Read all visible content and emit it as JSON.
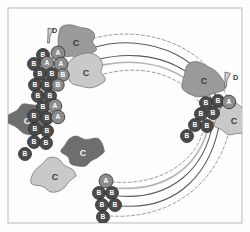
{
  "figure": {
    "type": "circular-arc-diagram",
    "background_color": "#fefefe",
    "frame": {
      "name": "plot-frame",
      "x": 8,
      "y": 8,
      "width": 234,
      "height": 215,
      "stroke": "#b9b9b9",
      "stroke_width": 1
    },
    "palette": {
      "blob_dark": "#6e6e6e",
      "blob_medium": "#9a9a9a",
      "blob_light": "#c9c9c9",
      "blob_lighter": "#d8d8d8",
      "blob_stroke": "#6a6a6a",
      "badge_fill": "#4b4b4b",
      "badge_fill_light": "#8c8c8c",
      "badge_text": "#ffffff",
      "badge_stroke": "#2e2e2e",
      "arc_dark": "#5a5a5a",
      "arc_light": "#b5b5b5",
      "arc_dashed": "#9a9a9a",
      "pin_fill": "#cdcdcd",
      "pin_stroke": "#555555",
      "label_text": "#3a3a3a"
    },
    "labels": {
      "blob": "C",
      "badge_a": "A",
      "badge_b": "B",
      "pin": "D"
    }
  },
  "chart_data": {
    "type": "scatter",
    "title": "",
    "subtitle": "",
    "xlabel": "",
    "ylabel": "",
    "grid": false,
    "legend": null,
    "xlim": [
      0,
      250
    ],
    "ylim": [
      0,
      232
    ],
    "blobs": [
      {
        "id": "blob-1",
        "label": "C",
        "cx": 76,
        "cy": 42,
        "rx": 22,
        "ry": 18,
        "shade": "blob_medium",
        "label_x": 76,
        "label_y": 44,
        "label_size": 9
      },
      {
        "id": "blob-2",
        "label": "C",
        "cx": 85,
        "cy": 72,
        "rx": 24,
        "ry": 18,
        "shade": "blob_light",
        "label_x": 86,
        "label_y": 74,
        "label_size": 9
      },
      {
        "id": "blob-3",
        "label": "C",
        "cx": 27,
        "cy": 120,
        "rx": 22,
        "ry": 17,
        "shade": "blob_dark",
        "label_x": 27,
        "label_y": 122,
        "label_size": 9
      },
      {
        "id": "blob-4",
        "label": "C",
        "cx": 82,
        "cy": 152,
        "rx": 22,
        "ry": 17,
        "shade": "blob_dark",
        "label_x": 83,
        "label_y": 154,
        "label_size": 9
      },
      {
        "id": "blob-5",
        "label": "C",
        "cx": 54,
        "cy": 176,
        "rx": 24,
        "ry": 19,
        "shade": "blob_light",
        "label_x": 55,
        "label_y": 178,
        "label_size": 9
      },
      {
        "id": "blob-6",
        "label": "C",
        "cx": 203,
        "cy": 80,
        "rx": 24,
        "ry": 19,
        "shade": "blob_medium",
        "label_x": 204,
        "label_y": 82,
        "label_size": 9
      },
      {
        "id": "blob-7",
        "label": "C",
        "cx": 232,
        "cy": 120,
        "rx": 22,
        "ry": 17,
        "shade": "blob_light",
        "label_x": 234,
        "label_y": 122,
        "label_size": 9
      }
    ],
    "badges": [
      {
        "id": "n1",
        "label": "B",
        "cx": 43,
        "cy": 55,
        "r": 6.5,
        "tone": "badge_fill"
      },
      {
        "id": "n2",
        "label": "A",
        "cx": 58,
        "cy": 53,
        "r": 7.0,
        "tone": "badge_fill_light"
      },
      {
        "id": "n3",
        "label": "B",
        "cx": 34,
        "cy": 64,
        "r": 6.5,
        "tone": "badge_fill"
      },
      {
        "id": "n4",
        "label": "A",
        "cx": 47,
        "cy": 63,
        "r": 6.8,
        "tone": "badge_fill_light"
      },
      {
        "id": "n5",
        "label": "A",
        "cx": 61,
        "cy": 64,
        "r": 6.8,
        "tone": "badge_fill_light"
      },
      {
        "id": "n6",
        "label": "B",
        "cx": 40,
        "cy": 74,
        "r": 6.5,
        "tone": "badge_fill"
      },
      {
        "id": "n7",
        "label": "B",
        "cx": 52,
        "cy": 74,
        "r": 6.5,
        "tone": "badge_fill"
      },
      {
        "id": "n8",
        "label": "B",
        "cx": 63,
        "cy": 75,
        "r": 6.2,
        "tone": "badge_fill_light"
      },
      {
        "id": "n9",
        "label": "B",
        "cx": 35,
        "cy": 85,
        "r": 6.5,
        "tone": "badge_fill"
      },
      {
        "id": "n10",
        "label": "B",
        "cx": 47,
        "cy": 85,
        "r": 6.5,
        "tone": "badge_fill"
      },
      {
        "id": "n11",
        "label": "B",
        "cx": 58,
        "cy": 85,
        "r": 6.2,
        "tone": "badge_fill_light"
      },
      {
        "id": "n12",
        "label": "B",
        "cx": 38,
        "cy": 96,
        "r": 6.5,
        "tone": "badge_fill"
      },
      {
        "id": "n13",
        "label": "B",
        "cx": 50,
        "cy": 96,
        "r": 6.5,
        "tone": "badge_fill"
      },
      {
        "id": "n14",
        "label": "B",
        "cx": 43,
        "cy": 107,
        "r": 6.5,
        "tone": "badge_fill"
      },
      {
        "id": "n15",
        "label": "A",
        "cx": 55,
        "cy": 106,
        "r": 6.8,
        "tone": "badge_fill_light"
      },
      {
        "id": "n16",
        "label": "B",
        "cx": 34,
        "cy": 116,
        "r": 6.5,
        "tone": "badge_fill"
      },
      {
        "id": "n17",
        "label": "B",
        "cx": 47,
        "cy": 118,
        "r": 6.5,
        "tone": "badge_fill"
      },
      {
        "id": "n18",
        "label": "A",
        "cx": 58,
        "cy": 117,
        "r": 6.8,
        "tone": "badge_fill_light"
      },
      {
        "id": "n19",
        "label": "B",
        "cx": 35,
        "cy": 129,
        "r": 6.5,
        "tone": "badge_fill"
      },
      {
        "id": "n20",
        "label": "B",
        "cx": 47,
        "cy": 131,
        "r": 6.5,
        "tone": "badge_fill"
      },
      {
        "id": "n21",
        "label": "B",
        "cx": 34,
        "cy": 142,
        "r": 6.5,
        "tone": "badge_fill"
      },
      {
        "id": "n22",
        "label": "B",
        "cx": 46,
        "cy": 143,
        "r": 6.5,
        "tone": "badge_fill"
      },
      {
        "id": "n23",
        "label": "B",
        "cx": 25,
        "cy": 154,
        "r": 6.5,
        "tone": "badge_fill"
      },
      {
        "id": "n24",
        "label": "A",
        "cx": 106,
        "cy": 181,
        "r": 7.0,
        "tone": "badge_fill_light"
      },
      {
        "id": "n25",
        "label": "B",
        "cx": 99,
        "cy": 193,
        "r": 6.5,
        "tone": "badge_fill"
      },
      {
        "id": "n26",
        "label": "B",
        "cx": 112,
        "cy": 193,
        "r": 6.5,
        "tone": "badge_fill"
      },
      {
        "id": "n27",
        "label": "B",
        "cx": 102,
        "cy": 205,
        "r": 6.5,
        "tone": "badge_fill"
      },
      {
        "id": "n28",
        "label": "B",
        "cx": 115,
        "cy": 205,
        "r": 6.5,
        "tone": "badge_fill"
      },
      {
        "id": "n29",
        "label": "B",
        "cx": 103,
        "cy": 217,
        "r": 6.5,
        "tone": "badge_fill"
      },
      {
        "id": "n30",
        "label": "B",
        "cx": 206,
        "cy": 103,
        "r": 6.5,
        "tone": "badge_fill"
      },
      {
        "id": "n31",
        "label": "B",
        "cx": 218,
        "cy": 101,
        "r": 6.5,
        "tone": "badge_fill"
      },
      {
        "id": "n32",
        "label": "A",
        "cx": 229,
        "cy": 102,
        "r": 6.8,
        "tone": "badge_fill_light"
      },
      {
        "id": "n33",
        "label": "B",
        "cx": 201,
        "cy": 114,
        "r": 6.5,
        "tone": "badge_fill"
      },
      {
        "id": "n34",
        "label": "B",
        "cx": 213,
        "cy": 113,
        "r": 6.5,
        "tone": "badge_fill"
      },
      {
        "id": "n35",
        "label": "B",
        "cx": 195,
        "cy": 125,
        "r": 6.5,
        "tone": "badge_fill"
      },
      {
        "id": "n36",
        "label": "B",
        "cx": 207,
        "cy": 126,
        "r": 6.5,
        "tone": "badge_fill"
      },
      {
        "id": "n37",
        "label": "B",
        "cx": 187,
        "cy": 136,
        "r": 6.5,
        "tone": "badge_fill"
      }
    ],
    "pins": [
      {
        "id": "pin-left",
        "label": "D",
        "x": 48,
        "y": 28,
        "label_x": 52,
        "label_y": 31
      },
      {
        "id": "pin-right",
        "label": "D",
        "x": 225,
        "y": 72,
        "label_x": 233,
        "label_y": 78
      }
    ],
    "arcs": [
      {
        "id": "arc-1",
        "style": "solid",
        "color": "arc_dark",
        "width": 1.1,
        "d": "M 92,48 C 150,30 215,60 222,118"
      },
      {
        "id": "arc-2",
        "style": "solid",
        "color": "arc_dark",
        "width": 1.1,
        "d": "M 96,60 C 155,44 212,72 219,122"
      },
      {
        "id": "arc-3",
        "style": "solid",
        "color": "arc_light",
        "width": 1.6,
        "d": "M 99,66 C 158,52 208,80 214,124"
      },
      {
        "id": "arc-4",
        "style": "dashed",
        "color": "arc_dashed",
        "width": 1.0,
        "d": "M 88,40 C 150,20 224,52 232,118"
      },
      {
        "id": "arc-5",
        "style": "dashed",
        "color": "arc_dashed",
        "width": 1.0,
        "d": "M 104,74 C 158,60 202,86 208,126"
      },
      {
        "id": "arc-6",
        "style": "solid",
        "color": "arc_dark",
        "width": 1.1,
        "d": "M 119,196 C 170,200 205,170 213,122"
      },
      {
        "id": "arc-7",
        "style": "solid",
        "color": "arc_dark",
        "width": 1.1,
        "d": "M 122,206 C 178,210 212,172 220,120"
      },
      {
        "id": "arc-8",
        "style": "solid",
        "color": "arc_light",
        "width": 1.6,
        "d": "M 116,188 C 166,192 200,166 209,124"
      },
      {
        "id": "arc-9",
        "style": "dashed",
        "color": "arc_dashed",
        "width": 1.0,
        "d": "M 110,216 C 178,220 222,176 231,122"
      },
      {
        "id": "arc-10",
        "style": "dashed",
        "color": "arc_dashed",
        "width": 1.0,
        "d": "M 112,182 C 160,186 196,162 204,128"
      }
    ]
  }
}
